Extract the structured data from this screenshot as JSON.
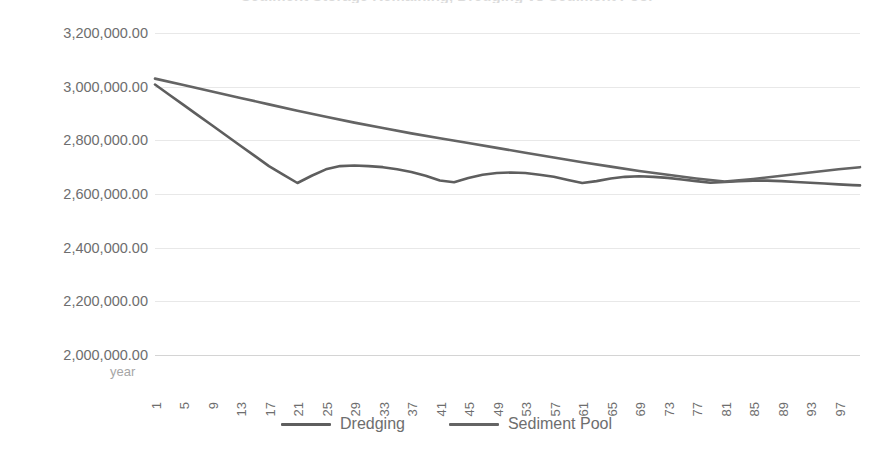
{
  "chart_data": {
    "type": "line",
    "title": "Sediment Storage Remaining, Dredging vs Sediment Pool",
    "xlabel": "year",
    "ylabel": "",
    "ylim": [
      2000000,
      3200000
    ],
    "xlim": [
      1,
      100
    ],
    "grid": true,
    "legend_position": "bottom",
    "y_tick_labels": [
      "3,200,000.00",
      "3,000,000.00",
      "2,800,000.00",
      "2,600,000.00",
      "2,400,000.00",
      "2,200,000.00",
      "2,000,000.00"
    ],
    "y_ticks": [
      3200000,
      3000000,
      2800000,
      2600000,
      2400000,
      2200000,
      2000000
    ],
    "x_tick_labels": [
      "1",
      "5",
      "9",
      "13",
      "17",
      "21",
      "25",
      "29",
      "33",
      "37",
      "41",
      "45",
      "49",
      "53",
      "57",
      "61",
      "65",
      "69",
      "73",
      "77",
      "81",
      "85",
      "89",
      "93",
      "97"
    ],
    "x_ticks": [
      1,
      5,
      9,
      13,
      17,
      21,
      25,
      29,
      33,
      37,
      41,
      45,
      49,
      53,
      57,
      61,
      65,
      69,
      73,
      77,
      81,
      85,
      89,
      93,
      97
    ],
    "series": [
      {
        "name": "Dredging",
        "color": "#5e5e5e",
        "x": [
          1,
          3,
          5,
          7,
          9,
          11,
          13,
          15,
          17,
          19,
          21,
          23,
          25,
          27,
          29,
          31,
          33,
          35,
          37,
          39,
          41,
          43,
          45,
          47,
          49,
          51,
          53,
          55,
          57,
          59,
          61,
          63,
          65,
          67,
          69,
          71,
          73,
          75,
          77,
          79,
          81,
          83,
          85,
          87,
          89,
          91,
          93,
          95,
          97,
          99,
          100
        ],
        "values": [
          3008000,
          2970000,
          2932000,
          2894000,
          2856000,
          2818000,
          2780000,
          2742000,
          2704000,
          2672000,
          2641000,
          2668000,
          2692000,
          2704000,
          2706000,
          2704000,
          2700000,
          2692000,
          2682000,
          2668000,
          2650000,
          2644000,
          2660000,
          2672000,
          2678000,
          2680000,
          2678000,
          2672000,
          2664000,
          2652000,
          2641000,
          2648000,
          2658000,
          2664000,
          2666000,
          2664000,
          2660000,
          2654000,
          2648000,
          2642000,
          2645000,
          2648000,
          2650000,
          2650000,
          2648000,
          2645000,
          2642000,
          2639000,
          2636000,
          2633000,
          2632000
        ]
      },
      {
        "name": "Sediment Pool",
        "color": "#646464",
        "x": [
          1,
          5,
          9,
          13,
          17,
          21,
          25,
          29,
          33,
          37,
          41,
          45,
          49,
          53,
          57,
          61,
          65,
          69,
          73,
          77,
          81,
          85,
          89,
          93,
          97,
          100
        ],
        "values": [
          3030000,
          3006000,
          2982000,
          2958000,
          2934000,
          2910000,
          2888000,
          2866000,
          2846000,
          2826000,
          2808000,
          2790000,
          2772000,
          2754000,
          2736000,
          2718000,
          2702000,
          2686000,
          2672000,
          2658000,
          2646000,
          2656000,
          2668000,
          2680000,
          2692000,
          2700000
        ]
      }
    ]
  },
  "legend": {
    "items": [
      {
        "label": "Dredging"
      },
      {
        "label": "Sediment Pool"
      }
    ]
  },
  "axis": {
    "x_title": "year"
  },
  "colors": {
    "series_dredging": "#5e5e5e",
    "series_sediment_pool": "#646464",
    "gridline": "#e8e8e8",
    "tick_text": "#6e6e6e",
    "axis_title_text": "#a6a6a6"
  }
}
